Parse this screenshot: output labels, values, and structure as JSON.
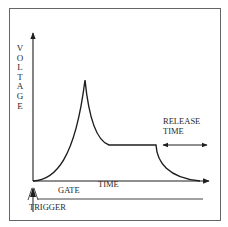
{
  "diagram": {
    "type": "ADSR envelope",
    "y_axis_label": "VOLTAGE",
    "x_axis_label": "TIME",
    "annotations": {
      "release": "RELEASE\nTIME",
      "gate": "GATE",
      "trigger": "TRIGGER"
    },
    "stages": [
      "attack",
      "decay",
      "sustain",
      "release"
    ],
    "colors": {
      "line": "#1e1e1e",
      "frame": "#555555",
      "background": "#ffffff"
    }
  }
}
